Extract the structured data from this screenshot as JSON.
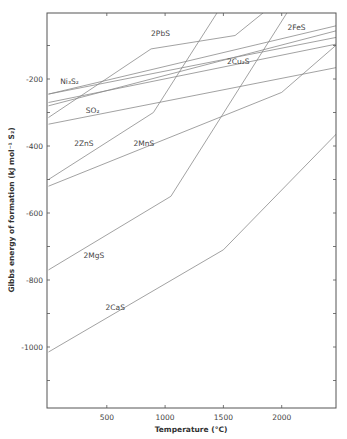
{
  "chart_data": {
    "type": "line",
    "title": "",
    "xlabel": "Temperature (°C)",
    "ylabel": "Gibbs energy of formation (kJ mol⁻¹ S₂)",
    "xlim": [
      0,
      2480
    ],
    "ylim": [
      -1180,
      0
    ],
    "xticks": [
      500,
      1000,
      1500,
      2000
    ],
    "xtick_labels": [
      "500",
      "1000",
      "1500",
      "2000"
    ],
    "yticks": [
      -200,
      -400,
      -600,
      -800,
      -1000
    ],
    "ytick_labels": [
      "-200",
      "-400",
      "-600",
      "-800",
      "-1000"
    ],
    "grid": false,
    "legend": "inline labels",
    "series": [
      {
        "name": "2PbS",
        "label": "2PbS",
        "points": [
          [
            0,
            -315
          ],
          [
            880,
            -110
          ],
          [
            1600,
            -70
          ],
          [
            1850,
            0
          ]
        ],
        "label_pos": [
          880,
          -70
        ]
      },
      {
        "name": "Ni3S2",
        "label": "Ni₃S₂",
        "points": [
          [
            0,
            -245
          ],
          [
            2480,
            -40
          ]
        ],
        "label_pos": [
          100,
          -215
        ]
      },
      {
        "name": "2FeS",
        "label": "2FeS",
        "points": [
          [
            0,
            -280
          ],
          [
            2480,
            -55
          ]
        ],
        "label_pos": [
          2050,
          -55
        ]
      },
      {
        "name": "2Cu2S",
        "label": "2Cu₂S",
        "points": [
          [
            0,
            -245
          ],
          [
            2480,
            -75
          ]
        ],
        "label_pos": [
          1530,
          -155
        ]
      },
      {
        "name": "2Cu2S_b",
        "label": "",
        "points": [
          [
            0,
            -270
          ],
          [
            2480,
            -95
          ]
        ],
        "label_pos": null
      },
      {
        "name": "SO2",
        "label": "SO₂",
        "points": [
          [
            0,
            -335
          ],
          [
            2480,
            -165
          ]
        ],
        "label_pos": [
          320,
          -300
        ]
      },
      {
        "name": "2ZnS",
        "label": "2ZnS",
        "points": [
          [
            0,
            -500
          ],
          [
            900,
            -300
          ],
          [
            1450,
            0
          ]
        ],
        "label_pos": [
          220,
          -400
        ]
      },
      {
        "name": "2MnS",
        "label": "2MnS",
        "points": [
          [
            0,
            -520
          ],
          [
            2000,
            -240
          ],
          [
            2480,
            -95
          ]
        ],
        "label_pos": [
          730,
          -400
        ]
      },
      {
        "name": "2MgS",
        "label": "2MgS",
        "points": [
          [
            0,
            -770
          ],
          [
            1050,
            -550
          ],
          [
            2050,
            0
          ]
        ],
        "label_pos": [
          300,
          -735
        ]
      },
      {
        "name": "2CaS",
        "label": "2CaS",
        "points": [
          [
            0,
            -1015
          ],
          [
            1500,
            -710
          ],
          [
            2480,
            -360
          ]
        ],
        "label_pos": [
          490,
          -890
        ]
      }
    ]
  },
  "axes": {
    "x_title": "Temperature (°C)",
    "y_title": "Gibbs energy of formation (kJ mol⁻¹ S₂)"
  }
}
